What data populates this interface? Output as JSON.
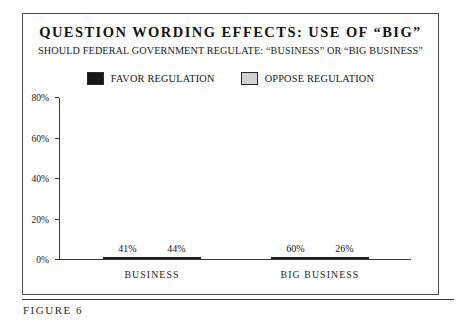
{
  "figure": {
    "caption": "FIGURE 6"
  },
  "chart_data": {
    "type": "bar",
    "title": "QUESTION WORDING EFFECTS: USE OF “BIG”",
    "subtitle": "SHOULD FEDERAL GOVERNMENT REGULATE: “BUSINESS” OR “BIG BUSINESS”",
    "xlabel": "",
    "ylabel": "",
    "categories": [
      "BUSINESS",
      "BIG BUSINESS"
    ],
    "series": [
      {
        "name": "FAVOR REGULATION",
        "color": "#171717",
        "values": [
          41,
          60
        ],
        "labels": [
          "41%",
          "44%"
        ]
      },
      {
        "name": "OPPOSE REGULATION",
        "color": "#d2d2d2",
        "values": [
          44,
          26
        ],
        "labels": [
          "60%",
          "26%"
        ]
      }
    ],
    "bars": [
      {
        "category": "BUSINESS",
        "series": "FAVOR REGULATION",
        "value": 41,
        "label": "41%"
      },
      {
        "category": "BUSINESS",
        "series": "OPPOSE REGULATION",
        "value": 44,
        "label": "44%"
      },
      {
        "category": "BIG BUSINESS",
        "series": "FAVOR REGULATION",
        "value": 60,
        "label": "60%"
      },
      {
        "category": "BIG BUSINESS",
        "series": "OPPOSE REGULATION",
        "value": 26,
        "label": "26%"
      }
    ],
    "ylim": [
      0,
      80
    ],
    "yticks": [
      "0%",
      "20%",
      "40%",
      "60%",
      "80%"
    ],
    "ytick_values": [
      0,
      20,
      40,
      60,
      80
    ],
    "grid": false,
    "legend_position": "top",
    "legend": [
      "FAVOR REGULATION",
      "OPPOSE REGULATION"
    ]
  },
  "colors": {
    "favor": "#171717",
    "oppose": "#d2d2d2",
    "axis": "#3c3c3c",
    "frame": "#4a4a52"
  }
}
